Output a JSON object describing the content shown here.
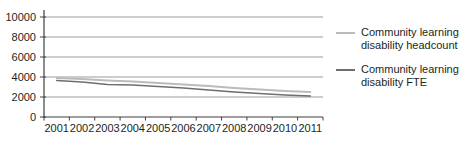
{
  "chart_data": {
    "type": "line",
    "title": "",
    "xlabel": "",
    "ylabel": "",
    "categories": [
      "2001",
      "2002",
      "2003",
      "2004",
      "2005",
      "2006",
      "2007",
      "2008",
      "2009",
      "2010",
      "2011"
    ],
    "series": [
      {
        "name": "Community learning disability headcount",
        "legend_lines": [
          "Community learning",
          "disability headcount"
        ],
        "values": [
          3900,
          3800,
          3650,
          3550,
          3400,
          3250,
          3100,
          2900,
          2750,
          2600,
          2500
        ],
        "color": "#b9bbbd",
        "stroke_width": 2
      },
      {
        "name": "Community learning disability FTE",
        "legend_lines": [
          "Community learning",
          "disability FTE"
        ],
        "values": [
          3650,
          3500,
          3250,
          3200,
          3050,
          2900,
          2700,
          2500,
          2350,
          2200,
          2100
        ],
        "color": "#6d6e71",
        "stroke_width": 1.6
      }
    ],
    "ylim": [
      0,
      10000
    ],
    "yticks": [
      0,
      2000,
      4000,
      6000,
      8000,
      10000
    ],
    "ytick_labels": [
      "0",
      "2000",
      "4000",
      "6000",
      "8000",
      "10000"
    ],
    "grid": true,
    "legend_position": "right"
  },
  "colors": {
    "background": "#ffffff",
    "grid": "#9b9b9b",
    "axis": "#3f3f3f",
    "text": "#231f20"
  }
}
